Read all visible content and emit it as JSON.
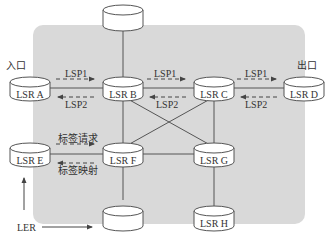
{
  "diagram": {
    "colors": {
      "region_fill": "#d9d9d9",
      "line": "#555555",
      "node_fill": "#ffffff",
      "text": "#333333"
    },
    "nodes": {
      "top": {
        "label": ""
      },
      "lsr_a": {
        "label": "LSR A"
      },
      "lsr_b": {
        "label": "LSR B"
      },
      "lsr_c": {
        "label": "LSR C"
      },
      "lsr_d": {
        "label": "LSR D"
      },
      "lsr_e": {
        "label": "LSR E"
      },
      "lsr_f": {
        "label": "LSR F"
      },
      "lsr_g": {
        "label": "LSR G"
      },
      "lsr_h": {
        "label": "LSR H"
      },
      "bottom": {
        "label": ""
      }
    },
    "labels": {
      "ingress": "入口",
      "egress": "出口",
      "lsp1_ab": "LSP1",
      "lsp2_ab": "LSP2",
      "lsp1_bc": "LSP1",
      "lsp2_bc": "LSP2",
      "lsp1_cd": "LSP1",
      "lsp2_cd": "LSP2",
      "label_request": "标签请求",
      "label_mapping": "标签映射",
      "ler": "LER"
    },
    "edges": [
      [
        "top",
        "lsr_b"
      ],
      [
        "lsr_a",
        "lsr_b"
      ],
      [
        "lsr_b",
        "lsr_c"
      ],
      [
        "lsr_c",
        "lsr_d"
      ],
      [
        "lsr_b",
        "lsr_f"
      ],
      [
        "lsr_b",
        "lsr_g"
      ],
      [
        "lsr_c",
        "lsr_f"
      ],
      [
        "lsr_c",
        "lsr_g"
      ],
      [
        "lsr_e",
        "lsr_f"
      ],
      [
        "lsr_f",
        "lsr_g"
      ],
      [
        "lsr_f",
        "bottom"
      ],
      [
        "lsr_g",
        "lsr_h"
      ]
    ]
  }
}
